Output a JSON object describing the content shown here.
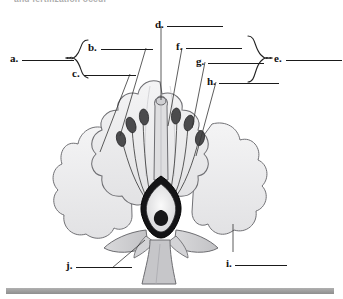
{
  "page": {
    "heading_clipped": "and fertilization occur",
    "background_color": "#ffffff",
    "bottom_bar_color": "#9a9a9a"
  },
  "diagram": {
    "name": "flower-cross-section",
    "caption": "",
    "parts": {
      "petal_fill": "#ededee",
      "petal_stroke": "#6f6f6f",
      "anther_fill": "#4a4a4a",
      "filament_stroke": "#5a5a5a",
      "ovary_ring": "#111111",
      "ovary_inner": "#e9e9ea",
      "sepal_fill": "#cfcfd1",
      "stem_fill": "#c9c9cb",
      "style_fill": "#dcdcde"
    }
  },
  "labels": {
    "left_group_brace": "left-brace",
    "right_group_brace": "right-brace",
    "items": [
      {
        "key": "a",
        "text": "a.",
        "line_width": 52
      },
      {
        "key": "b",
        "text": "b.",
        "line_width": 52
      },
      {
        "key": "c",
        "text": "c.",
        "line_width": 52
      },
      {
        "key": "d",
        "text": "d.",
        "line_width": 56
      },
      {
        "key": "e",
        "text": "e.",
        "line_width": 56
      },
      {
        "key": "f",
        "text": "f.",
        "line_width": 56
      },
      {
        "key": "g",
        "text": "g.",
        "line_width": 56
      },
      {
        "key": "h",
        "text": "h.",
        "line_width": 60
      },
      {
        "key": "i",
        "text": "i.",
        "line_width": 52
      },
      {
        "key": "j",
        "text": "j.",
        "line_width": 56
      }
    ]
  }
}
